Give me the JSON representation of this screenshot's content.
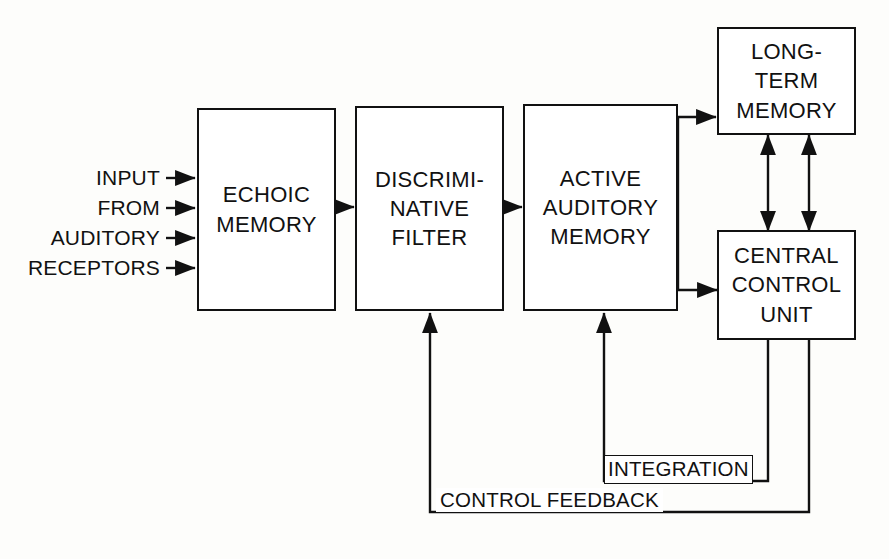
{
  "diagram": {
    "background_color": "#fdfdfb",
    "line_color": "#111111",
    "nodes": [
      {
        "id": "echoic",
        "label": "ECHOIC\nMEMORY"
      },
      {
        "id": "filter",
        "label": "DISCRIMI-\nNATIVE\nFILTER"
      },
      {
        "id": "active",
        "label": "ACTIVE\nAUDITORY\nMEMORY"
      },
      {
        "id": "ltm",
        "label": "LONG-\nTERM\nMEMORY"
      },
      {
        "id": "ccu",
        "label": "CENTRAL\nCONTROL\nUNIT"
      }
    ],
    "input_labels": [
      {
        "id": "input",
        "text": "INPUT"
      },
      {
        "id": "from",
        "text": "FROM"
      },
      {
        "id": "auditory",
        "text": "AUDITORY"
      },
      {
        "id": "receptors",
        "text": "RECEPTORS"
      }
    ],
    "edge_labels": [
      {
        "id": "integration",
        "text": "INTEGRATION"
      },
      {
        "id": "control-feedback",
        "text": "CONTROL FEEDBACK"
      }
    ]
  }
}
